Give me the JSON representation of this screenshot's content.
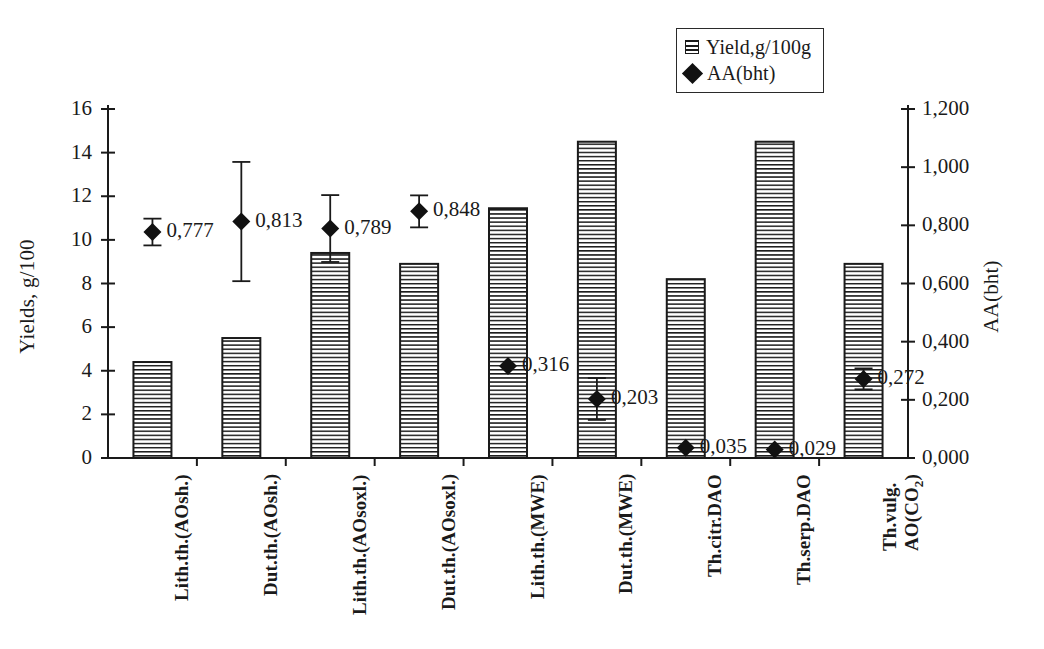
{
  "chart_data": {
    "type": "bar",
    "title": "",
    "subtitle": "",
    "xlabel": "",
    "ylabel": "Yields, g/100",
    "y2label": "AA(bht)",
    "grid": false,
    "legend_position": "top-right",
    "categories": [
      "Lith.th.(AOsh.)",
      "Dut.th.(AOsh.)",
      "Lith.th.(AOsoxl.)",
      "Dut.th.(AOsoxl.)",
      "Lith.th.(MWE)",
      "Dut.th.(MWE)",
      "Th.citr.DAO",
      "Th.serp.DAO",
      "Th.vulg. AO(CO2)"
    ],
    "ylim": [
      0,
      16
    ],
    "yticks": [
      "0",
      "2",
      "4",
      "6",
      "8",
      "10",
      "12",
      "14",
      "16"
    ],
    "ytick_values": [
      0,
      2,
      4,
      6,
      8,
      10,
      12,
      14,
      16
    ],
    "y2lim": [
      0,
      1.2
    ],
    "y2ticks": [
      "0,000",
      "0,200",
      "0,400",
      "0,600",
      "0,800",
      "1,000",
      "1,200"
    ],
    "y2tick_values": [
      0,
      0.2,
      0.4,
      0.6,
      0.8,
      1.0,
      1.2
    ],
    "series": [
      {
        "name": "Yield,g/100g",
        "type": "bar",
        "axis": "left",
        "values": [
          4.4,
          5.5,
          9.4,
          8.9,
          11.45,
          14.5,
          8.2,
          14.5,
          8.9
        ]
      },
      {
        "name": "AA(bht)",
        "type": "scatter",
        "axis": "right",
        "values": [
          0.777,
          0.813,
          0.789,
          0.848,
          0.316,
          0.203,
          0.035,
          0.029,
          0.272
        ],
        "value_labels": [
          "0,777",
          "0,813",
          "0,789",
          "0,848",
          "0,316",
          "0,203",
          "0,035",
          "0,029",
          "0,272"
        ],
        "errors": [
          0.046,
          0.205,
          0.115,
          0.055,
          0.0,
          0.072,
          0.0,
          0.0,
          0.036
        ]
      }
    ]
  },
  "legend": {
    "items": [
      {
        "label": "Yield,g/100g",
        "marker": "hatched-square"
      },
      {
        "label": "AA(bht)",
        "marker": "filled-diamond"
      }
    ]
  },
  "axes": {
    "left_title": "Yields, g/100",
    "right_title": "AA(bht)"
  },
  "colors": {
    "axis": "#1a1a1a",
    "bar_stroke": "#1a1a1a",
    "bar_fill": "#ffffff",
    "hatch": "#1a1a1a",
    "marker": "#111111",
    "background": "#ffffff"
  }
}
